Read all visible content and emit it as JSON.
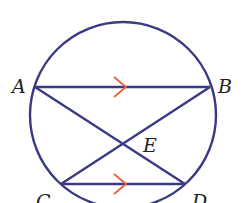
{
  "diagram": {
    "type": "circle-geometry",
    "colors": {
      "stroke": "#3a3a85",
      "arrow": "#e8603a",
      "label": "#222222"
    },
    "points": {
      "A": {
        "label": "A",
        "x": 35,
        "y": 87
      },
      "B": {
        "label": "B",
        "x": 210,
        "y": 87
      },
      "C": {
        "label": "C",
        "x": 61,
        "y": 184
      },
      "D": {
        "label": "D",
        "x": 185,
        "y": 184
      },
      "E": {
        "label": "E",
        "x": 123,
        "y": 143
      }
    },
    "segments": [
      "AB",
      "CD",
      "AD",
      "BC"
    ],
    "parallel_marks": [
      "AB",
      "CD"
    ]
  }
}
